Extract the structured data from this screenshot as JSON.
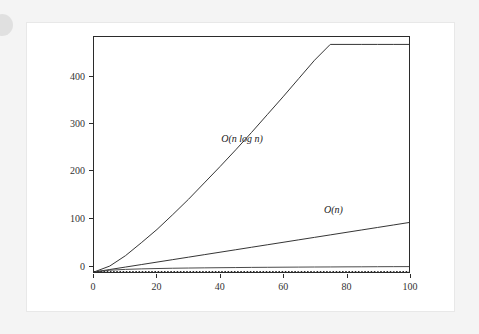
{
  "page": {
    "background_color": "#f4f4f4",
    "card_background": "#ffffff",
    "card_border_color": "#e8e8e8",
    "artifact_name": "page-edge-circle-artifact"
  },
  "chart_data": {
    "type": "line",
    "title": "",
    "subtitle": "",
    "xlabel": "",
    "ylabel": "",
    "xlim": [
      0,
      100
    ],
    "ylim": [
      0,
      475
    ],
    "grid": false,
    "legend_position": "inline-annotations",
    "frame_color": "#2b2b2b",
    "xticks": [
      0,
      20,
      40,
      60,
      80,
      100
    ],
    "xtick_labels": [
      "0",
      "20",
      "40",
      "60",
      "80",
      "100"
    ],
    "yticks": [
      0,
      100,
      200,
      300,
      400
    ],
    "ytick_labels": [
      "0",
      "100",
      "200",
      "300",
      "400"
    ],
    "x": [
      0,
      5,
      10,
      15,
      20,
      25,
      30,
      35,
      40,
      45,
      50,
      55,
      60,
      65,
      70,
      75,
      80,
      85,
      90,
      95,
      100
    ],
    "series": [
      {
        "name": "O(n log n)",
        "label": "O(n log n)",
        "color": "#333333",
        "style": "solid",
        "width": 1,
        "values": [
          0,
          11.6,
          33.2,
          58.6,
          86.4,
          116.1,
          147.2,
          179.5,
          212.9,
          247.1,
          282.0,
          317.7,
          354.0,
          390.8,
          428.2,
          466.1,
          504.5,
          543.3,
          582.5,
          622.1,
          664.4
        ],
        "values_displayed": [
          0,
          12,
          33,
          59,
          86,
          116,
          147,
          180,
          213,
          247,
          282,
          318,
          354,
          391,
          428,
          460,
          460,
          460,
          460,
          460,
          460
        ],
        "endpoint": [
          100,
          460
        ],
        "label_position": {
          "x": 47,
          "y": 270
        }
      },
      {
        "name": "O(n)",
        "label": "O(n)",
        "color": "#333333",
        "style": "solid",
        "width": 1,
        "values": [
          0,
          5,
          10,
          15,
          20,
          25,
          30,
          35,
          40,
          45,
          50,
          55,
          60,
          65,
          70,
          75,
          80,
          85,
          90,
          95,
          100
        ],
        "endpoint": [
          100,
          100
        ],
        "label_position": {
          "x": 76,
          "y": 128
        }
      },
      {
        "name": "O(log n)",
        "label": "",
        "color": "#4a4a4a",
        "style": "solid",
        "width": 1,
        "values": [
          0,
          3.6,
          5.3,
          6.3,
          7.0,
          7.6,
          8.0,
          8.4,
          8.7,
          9.0,
          9.3,
          9.5,
          9.7,
          9.9,
          10.1,
          10.2,
          10.4,
          10.5,
          10.7,
          10.8,
          10.9
        ],
        "endpoint": [
          100,
          11
        ]
      },
      {
        "name": "O(1)",
        "label": "",
        "color": "#2b2b2b",
        "style": "dotted",
        "width": 1,
        "values": [
          1,
          1,
          1,
          1,
          1,
          1,
          1,
          1,
          1,
          1,
          1,
          1,
          1,
          1,
          1,
          1,
          1,
          1,
          1,
          1,
          1
        ],
        "endpoint": [
          100,
          1
        ]
      }
    ],
    "annotations": [
      {
        "text": "O(n log n)",
        "x": 47,
        "y": 270
      },
      {
        "text": "O(n)",
        "x": 76,
        "y": 128
      }
    ]
  }
}
